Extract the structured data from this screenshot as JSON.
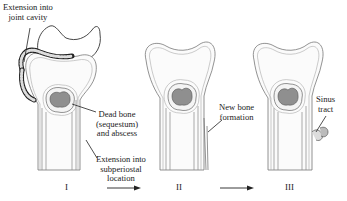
{
  "diagram": {
    "stages": [
      {
        "numeral": "I",
        "features": [
          "Extension into joint cavity",
          "Dead bone (sequestum) and abscess",
          "Extension into subperiostal location"
        ]
      },
      {
        "numeral": "II",
        "features": [
          "New bone formation"
        ]
      },
      {
        "numeral": "III",
        "features": [
          "Sinus tract"
        ]
      }
    ],
    "labels": {
      "joint_cavity_line1": "Extension into",
      "joint_cavity_line2": "joint cavity",
      "dead_bone_line1": "Dead bone",
      "dead_bone_line2": "(sequestum)",
      "dead_bone_line3": "and abscess",
      "subperiosteal_line1": "Extension into",
      "subperiosteal_line2": "subperiostal",
      "subperiosteal_line3": "location",
      "new_bone_line1": "New bone",
      "new_bone_line2": "formation",
      "sinus_line1": "Sinus",
      "sinus_line2": "tract"
    },
    "stage_labels": {
      "s1": "I",
      "s2": "II",
      "s3": "III"
    },
    "arrows": [
      "stage-I-to-II",
      "stage-II-to-III"
    ],
    "colors": {
      "sequestrum": "#8f8f8f",
      "outline": "#777777",
      "text": "#222222",
      "background": "#ffffff"
    }
  }
}
